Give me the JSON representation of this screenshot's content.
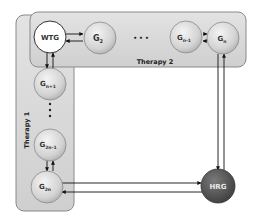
{
  "diagram": {
    "panels": [
      {
        "id": "therapy2",
        "label": "Therapy 2"
      },
      {
        "id": "therapy1",
        "label": "Therapy 1"
      }
    ],
    "nodes": {
      "wtg": {
        "label": "WTG",
        "sub": ""
      },
      "g2": {
        "label": "G",
        "sub": "2"
      },
      "gn1": {
        "label": "G",
        "sub": "n-1"
      },
      "gn": {
        "label": "G",
        "sub": "n"
      },
      "gnp1": {
        "label": "G",
        "sub": "n+1"
      },
      "g2n1": {
        "label": "G",
        "sub": "2n-1"
      },
      "g2n": {
        "label": "G",
        "sub": "2n"
      },
      "hrg": {
        "label": "HRG",
        "sub": ""
      }
    },
    "ellipsis_h": "• • •",
    "ellipsis_v": "•",
    "edges": [
      {
        "from": "WTG",
        "to": "G2",
        "bidirectional": true
      },
      {
        "from": "Gn-1",
        "to": "Gn",
        "bidirectional": true
      },
      {
        "from": "WTG",
        "to": "Gn+1",
        "bidirectional": true
      },
      {
        "from": "G2n-1",
        "to": "G2n",
        "bidirectional": true
      },
      {
        "from": "Gn",
        "to": "HRG",
        "bidirectional": true
      },
      {
        "from": "G2n",
        "to": "HRG",
        "bidirectional": true
      }
    ],
    "colors": {
      "panel_fill": "#d6d6d6",
      "panel_stroke": "#8a8a8a",
      "node_fill": "#d9d9d9",
      "wtg_fill": "#ffffff",
      "hrg_fill": "#5a5a5a",
      "hrg_text": "#e8e8e8",
      "edge": "#111111"
    }
  }
}
